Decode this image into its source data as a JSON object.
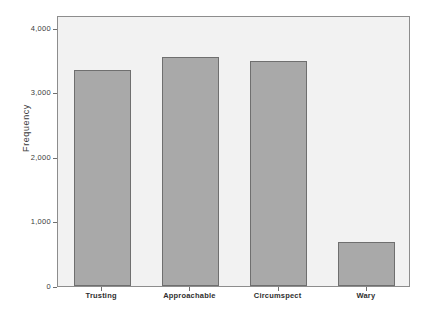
{
  "chart_data": {
    "type": "bar",
    "title": "",
    "xlabel": "",
    "ylabel": "Frequency",
    "categories": [
      "Trusting",
      "Approachable",
      "Circumspect",
      "Wary"
    ],
    "values": [
      3350,
      3550,
      3490,
      680
    ],
    "ylim": [
      0,
      4200
    ],
    "yticks": [
      0,
      1000,
      2000,
      3000,
      4000
    ],
    "ytick_labels": [
      "0",
      "1,000",
      "2,000",
      "3,000",
      "4,000"
    ],
    "grid": false,
    "legend": null,
    "bar_color": "#a9a9a9",
    "bar_border_color": "#6f6f6f",
    "plot_background": "#f2f2f2",
    "frame_color": "#8d8d8d",
    "axis_text_color": "#3b3b3b"
  }
}
